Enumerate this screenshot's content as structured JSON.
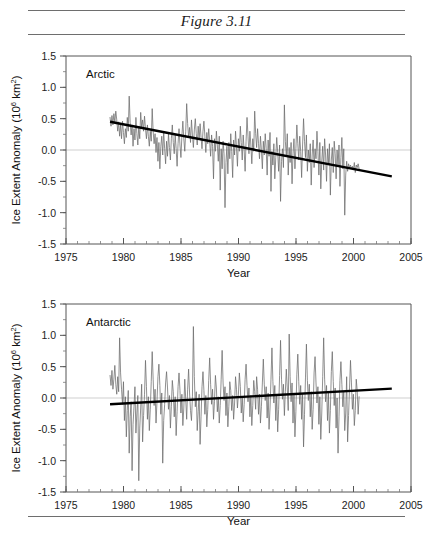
{
  "figure": {
    "title": "Figure 3.11",
    "rules": [
      "top",
      "middle",
      "bottom"
    ]
  },
  "axes": {
    "xlabel": "Year",
    "ylabel_main": "Ice Extent Anomaly (10",
    "ylabel_sup1": "6",
    "ylabel_mid": " km",
    "ylabel_sup2": "2",
    "ylabel_end": ")",
    "x_ticks": [
      "1975",
      "1980",
      "1985",
      "1990",
      "1995",
      "2000",
      "2005"
    ],
    "y_ticks": [
      "1.5",
      "1.0",
      "0.5",
      "0.0",
      "-0.5",
      "-1.0",
      "-1.5"
    ]
  },
  "colors": {
    "data_line": "#6b6b6b",
    "trend_line": "#000000",
    "axis": "#555555",
    "zero_line": "#c9c9c9",
    "rule": "#6e6e6e",
    "background": "#ffffff"
  },
  "chart_data": [
    {
      "type": "line",
      "title": "Arctic",
      "panel": "top",
      "xlabel": "Year",
      "ylabel": "Ice Extent Anomaly (10^6 km^2)",
      "xlim": [
        1975,
        2005
      ],
      "ylim": [
        -1.5,
        1.5
      ],
      "x_major_ticks": [
        1975,
        1980,
        1985,
        1990,
        1995,
        2000,
        2005
      ],
      "y_major_ticks": [
        -1.5,
        -1.0,
        -0.5,
        0.0,
        0.5,
        1.0,
        1.5
      ],
      "x_minor_interval": 1,
      "y_minor_interval": 0.25,
      "grid": false,
      "zero_reference_line": 0.0,
      "legend": "none",
      "series": [
        {
          "name": "Arctic ice extent anomaly",
          "style": "thin-gray-line",
          "x_start": 1978.83,
          "x_end": 2003.33,
          "x_step": 0.0833,
          "values": [
            0.52,
            0.38,
            0.55,
            0.4,
            0.58,
            0.44,
            0.62,
            0.48,
            0.3,
            0.45,
            0.22,
            0.4,
            0.18,
            0.46,
            0.28,
            0.1,
            0.34,
            0.2,
            0.52,
            0.3,
            0.86,
            0.44,
            0.24,
            0.4,
            0.06,
            0.34,
            0.16,
            0.52,
            0.26,
            0.08,
            0.38,
            0.18,
            0.6,
            0.36,
            0.48,
            0.3,
            0.54,
            0.34,
            0.18,
            0.4,
            0.22,
            0.06,
            0.3,
            0.14,
            0.66,
            0.3,
            0.1,
            0.26,
            -0.04,
            0.2,
            -0.18,
            0.12,
            -0.3,
            0.06,
            0.22,
            -0.08,
            0.3,
            0.02,
            -0.22,
            0.14,
            -0.1,
            0.26,
            0.04,
            -0.16,
            0.18,
            0.4,
            0.12,
            -0.06,
            0.24,
            0.02,
            -0.26,
            0.1,
            0.34,
            0.08,
            -0.12,
            0.22,
            0.46,
            0.18,
            -0.02,
            0.3,
            0.74,
            0.42,
            0.2,
            0.36,
            0.12,
            0.48,
            0.24,
            0.04,
            0.32,
            0.5,
            0.26,
            0.08,
            0.38,
            0.16,
            0.42,
            0.2,
            0.02,
            0.3,
            0.46,
            0.22,
            -0.04,
            0.28,
            0.1,
            0.34,
            0.14,
            -0.1,
            0.24,
            0.06,
            -0.46,
            0.18,
            -0.02,
            0.3,
            0.08,
            -0.18,
            0.22,
            -0.64,
            0.02,
            -0.3,
            0.14,
            -0.06,
            -0.92,
            -0.2,
            0.06,
            -0.38,
            0.12,
            -0.14,
            0.26,
            -0.02,
            -0.44,
            0.16,
            -0.08,
            0.3,
            0.04,
            -0.26,
            0.18,
            -0.02,
            0.38,
            0.12,
            -0.16,
            0.24,
            0.0,
            -0.34,
            0.14,
            0.52,
            0.22,
            -0.06,
            0.3,
            0.08,
            -0.22,
            0.18,
            -0.02,
            0.62,
            0.26,
            0.04,
            0.34,
            0.1,
            -0.14,
            0.22,
            0.0,
            -0.3,
            0.14,
            -0.08,
            0.26,
            0.02,
            -0.4,
            0.16,
            -0.1,
            0.28,
            -0.66,
            -0.02,
            -0.24,
            0.1,
            -0.46,
            -0.12,
            0.2,
            -0.04,
            -0.34,
            0.08,
            -0.82,
            -0.18,
            0.02,
            -0.28,
            0.72,
            0.14,
            -0.1,
            0.26,
            -0.4,
            0.04,
            -0.2,
            0.12,
            -0.54,
            -0.06,
            0.18,
            -0.3,
            0.02,
            0.4,
            0.1,
            -0.16,
            0.22,
            -0.02,
            -0.44,
            0.08,
            0.5,
            0.14,
            -0.12,
            0.24,
            -0.34,
            0.0,
            -0.2,
            0.1,
            -0.56,
            -0.08,
            0.16,
            -0.28,
            0.02,
            -0.14,
            0.3,
            -0.02,
            -0.4,
            0.12,
            -0.62,
            -0.18,
            0.06,
            -0.32,
            0.18,
            -0.08,
            -0.5,
            0.02,
            -0.24,
            0.1,
            -0.72,
            -0.16,
            0.04,
            -0.36,
            0.14,
            -0.06,
            -0.46,
            0.0,
            -0.26,
            0.08,
            -0.58,
            -0.12,
            0.2,
            -0.3,
            0.02,
            -1.04,
            -0.4,
            -0.18,
            -0.34,
            -0.22,
            -0.28,
            -0.24,
            -0.3,
            -0.26,
            -0.32,
            -0.2,
            -0.36,
            -0.24,
            -0.28,
            -0.22,
            -0.3
          ]
        }
      ],
      "trend": {
        "name": "Linear trend",
        "style": "thick-black-line",
        "x": [
          1978.83,
          2003.33
        ],
        "y": [
          0.45,
          -0.42
        ],
        "slope_per_decade": -0.355
      }
    },
    {
      "type": "line",
      "title": "Antarctic",
      "panel": "bottom",
      "xlabel": "Year",
      "ylabel": "Ice Extent Anomaly (10^6 km^2)",
      "xlim": [
        1975,
        2005
      ],
      "ylim": [
        -1.5,
        1.5
      ],
      "x_major_ticks": [
        1975,
        1980,
        1985,
        1990,
        1995,
        2000,
        2005
      ],
      "y_major_ticks": [
        -1.5,
        -1.0,
        -0.5,
        0.0,
        0.5,
        1.0,
        1.5
      ],
      "x_minor_interval": 1,
      "y_minor_interval": 0.25,
      "grid": false,
      "zero_reference_line": 0.0,
      "legend": "none",
      "series": [
        {
          "name": "Antarctic ice extent anomaly",
          "style": "thin-gray-line",
          "x_start": 1978.83,
          "x_end": 2003.33,
          "x_step": 0.0833,
          "values": [
            0.36,
            0.2,
            0.44,
            0.14,
            0.3,
            0.52,
            0.22,
            0.06,
            0.34,
            0.1,
            0.96,
            0.4,
            0.14,
            -0.1,
            0.26,
            -0.36,
            0.02,
            -0.62,
            -0.2,
            0.12,
            -0.88,
            -0.3,
            -0.06,
            -1.16,
            -0.42,
            -0.14,
            0.18,
            -0.56,
            -0.24,
            0.04,
            -1.32,
            -0.48,
            -0.16,
            0.22,
            -0.7,
            -0.28,
            0.06,
            0.6,
            0.18,
            -0.34,
            0.02,
            -0.52,
            -0.18,
            0.26,
            0.74,
            0.3,
            -0.12,
            0.14,
            -0.4,
            -0.06,
            0.34,
            0.54,
            0.2,
            -0.26,
            0.08,
            -1.04,
            -0.36,
            -0.1,
            0.24,
            0.42,
            0.16,
            -0.18,
            0.04,
            -0.48,
            -0.14,
            0.28,
            0.1,
            -0.3,
            0.02,
            -0.6,
            -0.22,
            0.18,
            0.4,
            0.12,
            -0.24,
            0.06,
            -0.44,
            -0.16,
            0.3,
            -0.02,
            -0.34,
            0.14,
            0.46,
            0.08,
            -0.2,
            -0.36,
            0.02,
            1.14,
            0.34,
            -0.14,
            0.1,
            -0.52,
            -0.22,
            0.06,
            -0.74,
            -0.3,
            0.18,
            0.42,
            0.12,
            -0.26,
            0.04,
            -0.46,
            -0.18,
            0.28,
            0.64,
            0.22,
            -0.1,
            0.14,
            -0.34,
            -0.06,
            0.36,
            0.16,
            -0.22,
            0.02,
            -0.4,
            -0.12,
            0.3,
            0.76,
            0.24,
            -0.04,
            0.18,
            -0.28,
            0.08,
            -0.46,
            -0.14,
            0.26,
            0.12,
            -0.2,
            0.04,
            -0.34,
            -0.08,
            0.34,
            0.14,
            -0.16,
            0.06,
            0.4,
            0.18,
            -0.24,
            0.02,
            -0.38,
            -0.1,
            0.3,
            0.54,
            0.2,
            -0.06,
            0.16,
            -0.3,
            0.04,
            -0.44,
            -0.12,
            0.28,
            0.1,
            -0.18,
            0.34,
            0.14,
            -0.26,
            0.06,
            -0.4,
            -0.14,
            0.24,
            0.62,
            0.22,
            -0.04,
            0.18,
            -0.32,
            0.08,
            -0.5,
            -0.16,
            0.3,
            0.8,
            0.26,
            -0.08,
            0.2,
            -0.36,
            0.04,
            -0.54,
            -0.18,
            0.36,
            0.92,
            0.3,
            -0.02,
            0.22,
            -0.28,
            0.1,
            0.46,
            0.16,
            -0.2,
            1.02,
            0.34,
            -0.06,
            0.24,
            -0.4,
            0.08,
            -0.62,
            -0.22,
            0.38,
            0.7,
            0.26,
            -0.1,
            0.2,
            -0.34,
            0.06,
            -0.78,
            -0.26,
            0.32,
            0.86,
            0.28,
            -0.04,
            0.22,
            -0.3,
            0.1,
            -0.5,
            -0.18,
            0.4,
            0.66,
            0.24,
            -0.08,
            0.18,
            -0.42,
            0.02,
            -0.66,
            -0.24,
            0.34,
            0.96,
            0.3,
            -0.06,
            0.2,
            -0.36,
            0.08,
            -0.56,
            -0.2,
            0.42,
            0.74,
            0.26,
            -0.12,
            0.16,
            -0.48,
            0.0,
            -0.88,
            -0.3,
            0.28,
            0.58,
            0.22,
            -0.14,
            0.1,
            -0.52,
            -0.24,
            0.34,
            -0.7,
            -0.28,
            0.16,
            0.6,
            0.24,
            -0.18,
            0.06,
            -0.44,
            -0.2,
            0.3,
            0.12,
            -0.26,
            0.02
          ]
        }
      ],
      "trend": {
        "name": "Linear trend",
        "style": "thick-black-line",
        "x": [
          1978.83,
          2003.33
        ],
        "y": [
          -0.1,
          0.15
        ],
        "slope_per_decade": 0.102
      }
    }
  ]
}
